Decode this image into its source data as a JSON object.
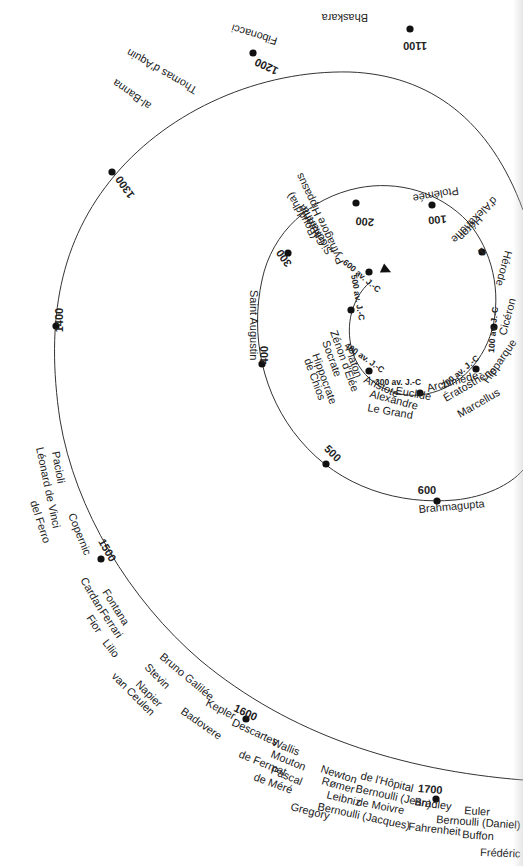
{
  "diagram": {
    "type": "spiral-timeline",
    "center": [
      390,
      322
    ],
    "colors": {
      "line": "#333333",
      "dot": "#111111",
      "text": "#222222",
      "background": "#ffffff"
    },
    "spiral_path": "M 370 282 C 352 298 345 325 352 350 C 360 380 390 398 420 395 C 455 391 482 365 492 330 C 502 292 492 250 468 222 C 440 192 398 180 358 188 C 310 198 272 232 262 280 C 250 335 262 395 300 440 C 340 488 400 505 455 500 C 485 497 510 485 523 470 M 523 210 C 490 120 430 75 350 72 C 260 70 170 110 115 175 C 60 240 45 320 60 420 C 75 510 130 600 200 660 C 290 735 400 770 523 780",
    "arrow": {
      "x": 382,
      "y": 268,
      "rotate": 25
    },
    "years": [
      {
        "label": "600 av. J.-C",
        "x": 360,
        "y": 278,
        "dot": [
          369,
          272
        ],
        "rotate": 40,
        "small": true
      },
      {
        "label": "500 av. J.-C",
        "x": 355,
        "y": 298,
        "dot": [
          351,
          310
        ],
        "rotate": 80,
        "small": true
      },
      {
        "label": "400 av. J.-C",
        "x": 363,
        "y": 360,
        "dot": [
          369,
          371
        ],
        "rotate": 35,
        "small": true
      },
      {
        "label": "300 av. J.-C",
        "x": 398,
        "y": 385,
        "dot": [
          420,
          393
        ],
        "rotate": 0,
        "small": true
      },
      {
        "label": "200 av. J.-C",
        "x": 462,
        "y": 374,
        "dot": [
          476,
          369
        ],
        "rotate": -40,
        "small": true
      },
      {
        "label": "100 av. J.-C",
        "x": 496,
        "y": 330,
        "dot": [
          494,
          327
        ],
        "rotate": -85,
        "small": true
      },
      {
        "label": "1",
        "x": 480,
        "y": 249,
        "dot": [
          482,
          252
        ],
        "rotate": 140,
        "small": false
      },
      {
        "label": "100",
        "x": 437,
        "y": 216,
        "dot": [
          432,
          205
        ],
        "rotate": 175,
        "small": false
      },
      {
        "label": "200",
        "x": 365,
        "y": 218,
        "dot": [
          356,
          203
        ],
        "rotate": 185,
        "small": false
      },
      {
        "label": "300",
        "x": 287,
        "y": 256,
        "dot": [
          288,
          253
        ],
        "rotate": 235,
        "small": false
      },
      {
        "label": "400",
        "x": 268,
        "y": 355,
        "dot": [
          262,
          364
        ],
        "rotate": 270,
        "small": false
      },
      {
        "label": "500",
        "x": 330,
        "y": 456,
        "dot": [
          326,
          464
        ],
        "rotate": 45,
        "small": false
      },
      {
        "label": "600",
        "x": 427,
        "y": 494,
        "dot": [
          437,
          501
        ],
        "rotate": 0,
        "small": false
      },
      {
        "label": "1100",
        "x": 415,
        "y": 42,
        "dot": [
          410,
          29
        ],
        "rotate": 180,
        "small": false
      },
      {
        "label": "1200",
        "x": 268,
        "y": 63,
        "dot": [
          253,
          53
        ],
        "rotate": 205,
        "small": false
      },
      {
        "label": "1300",
        "x": 128,
        "y": 185,
        "dot": [
          112,
          172
        ],
        "rotate": 235,
        "small": false
      },
      {
        "label": "1400",
        "x": 63,
        "y": 320,
        "dot": [
          56,
          326
        ],
        "rotate": 270,
        "small": false
      },
      {
        "label": "1500",
        "x": 104,
        "y": 552,
        "dot": [
          101,
          559
        ],
        "rotate": 60,
        "small": false
      },
      {
        "label": "1600",
        "x": 244,
        "y": 716,
        "dot": [
          246,
          719
        ],
        "rotate": 25,
        "small": false
      },
      {
        "label": "1700",
        "x": 430,
        "y": 793,
        "dot": [
          436,
          799
        ],
        "rotate": 5,
        "small": false
      }
    ],
    "names": [
      {
        "label": "Bhaskara",
        "x": 368,
        "y": 14,
        "rotate": 180
      },
      {
        "label": "Fibonacci",
        "x": 278,
        "y": 38,
        "rotate": 197
      },
      {
        "label": "Thomas d'Aquin",
        "x": 198,
        "y": 88,
        "rotate": 210
      },
      {
        "label": "al-Banna",
        "x": 152,
        "y": 104,
        "rotate": 215
      },
      {
        "label": "Ptolémée",
        "x": 458,
        "y": 187,
        "rotate": 170
      },
      {
        "label": "Héron",
        "x": 478,
        "y": 215,
        "rotate": 135
      },
      {
        "label": "d'Alexandrie",
        "x": 493,
        "y": 196,
        "rotate": 135
      },
      {
        "label": "Hérode",
        "x": 505,
        "y": 250,
        "rotate": 105
      },
      {
        "label": "(Bouddha)",
        "x": 318,
        "y": 236,
        "rotate": 240
      },
      {
        "label": "Gautama",
        "x": 326,
        "y": 243,
        "rotate": 240
      },
      {
        "label": "Siddhartha",
        "x": 333,
        "y": 252,
        "rotate": 240
      },
      {
        "label": "Pythagore Hippasus",
        "x": 344,
        "y": 262,
        "rotate": 245
      },
      {
        "label": "Platon",
        "x": 345,
        "y": 349,
        "rotate": 70
      },
      {
        "label": "Zénon d'Élée",
        "x": 330,
        "y": 332,
        "rotate": 70
      },
      {
        "label": "Socrate",
        "x": 322,
        "y": 342,
        "rotate": 70
      },
      {
        "label": "Hippocrate",
        "x": 312,
        "y": 355,
        "rotate": 70
      },
      {
        "label": "de Chios",
        "x": 304,
        "y": 360,
        "rotate": 70
      },
      {
        "label": "Saint Augustin",
        "x": 250,
        "y": 290,
        "rotate": 90
      },
      {
        "label": "Aristote",
        "x": 363,
        "y": 382,
        "rotate": 25
      },
      {
        "label": "Euclide",
        "x": 395,
        "y": 394,
        "rotate": 10
      },
      {
        "label": "Archimède",
        "x": 428,
        "y": 392,
        "rotate": -15
      },
      {
        "label": "Alexandre",
        "x": 369,
        "y": 397,
        "rotate": 15
      },
      {
        "label": "Le Grand",
        "x": 367,
        "y": 411,
        "rotate": 10
      },
      {
        "label": "Ératosthène",
        "x": 446,
        "y": 402,
        "rotate": -30
      },
      {
        "label": "Marcellus",
        "x": 460,
        "y": 418,
        "rotate": -30
      },
      {
        "label": "Hipparque",
        "x": 488,
        "y": 384,
        "rotate": -55
      },
      {
        "label": "Cicéron",
        "x": 506,
        "y": 336,
        "rotate": -75
      },
      {
        "label": "Brahmagupta",
        "x": 419,
        "y": 513,
        "rotate": -5
      },
      {
        "label": "Pacioli",
        "x": 52,
        "y": 452,
        "rotate": 80
      },
      {
        "label": "Léonard de Vinci",
        "x": 36,
        "y": 448,
        "rotate": 78
      },
      {
        "label": "del Ferro",
        "x": 30,
        "y": 502,
        "rotate": 72
      },
      {
        "label": "Copernic",
        "x": 68,
        "y": 515,
        "rotate": 68
      },
      {
        "label": "Cardan",
        "x": 80,
        "y": 580,
        "rotate": 60
      },
      {
        "label": "Fontana",
        "x": 102,
        "y": 592,
        "rotate": 58
      },
      {
        "label": "Ferrari",
        "x": 99,
        "y": 612,
        "rotate": 56
      },
      {
        "label": "Fior",
        "x": 86,
        "y": 618,
        "rotate": 56
      },
      {
        "label": "Lilio",
        "x": 102,
        "y": 643,
        "rotate": 52
      },
      {
        "label": "Bruno Galilée",
        "x": 159,
        "y": 658,
        "rotate": 40
      },
      {
        "label": "Kepler",
        "x": 205,
        "y": 705,
        "rotate": 28
      },
      {
        "label": "Stevin",
        "x": 144,
        "y": 668,
        "rotate": 45
      },
      {
        "label": "Napier",
        "x": 135,
        "y": 685,
        "rotate": 45
      },
      {
        "label": "van Ceulen",
        "x": 111,
        "y": 677,
        "rotate": 45
      },
      {
        "label": "Badovere",
        "x": 180,
        "y": 713,
        "rotate": 35
      },
      {
        "label": "Descartes",
        "x": 231,
        "y": 725,
        "rotate": 25
      },
      {
        "label": "Wallis",
        "x": 271,
        "y": 745,
        "rotate": 22
      },
      {
        "label": "Mouton",
        "x": 270,
        "y": 757,
        "rotate": 22
      },
      {
        "label": "de Fermat",
        "x": 238,
        "y": 757,
        "rotate": 22
      },
      {
        "label": "Pascal",
        "x": 270,
        "y": 773,
        "rotate": 22
      },
      {
        "label": "de Méré",
        "x": 253,
        "y": 780,
        "rotate": 20
      },
      {
        "label": "Newton",
        "x": 320,
        "y": 772,
        "rotate": 18
      },
      {
        "label": "de l'Hôpital",
        "x": 360,
        "y": 779,
        "rotate": 14
      },
      {
        "label": "Rømer",
        "x": 321,
        "y": 784,
        "rotate": 16
      },
      {
        "label": "Bernoulli (Jean)",
        "x": 355,
        "y": 792,
        "rotate": 12
      },
      {
        "label": "Leibniz",
        "x": 326,
        "y": 798,
        "rotate": 14
      },
      {
        "label": "de Moivre",
        "x": 356,
        "y": 805,
        "rotate": 11
      },
      {
        "label": "Bernoulli (Jacques)",
        "x": 317,
        "y": 810,
        "rotate": 12
      },
      {
        "label": "Gregory",
        "x": 290,
        "y": 810,
        "rotate": 14
      },
      {
        "label": "Bradley",
        "x": 414,
        "y": 805,
        "rotate": 8
      },
      {
        "label": "Euler",
        "x": 464,
        "y": 814,
        "rotate": 4
      },
      {
        "label": "Bernoulli (Daniel)",
        "x": 436,
        "y": 823,
        "rotate": 4
      },
      {
        "label": "Fahrenheit",
        "x": 408,
        "y": 830,
        "rotate": 6
      },
      {
        "label": "Buffon",
        "x": 462,
        "y": 838,
        "rotate": 4
      },
      {
        "label": "Frédéric",
        "x": 480,
        "y": 856,
        "rotate": 2
      }
    ]
  }
}
